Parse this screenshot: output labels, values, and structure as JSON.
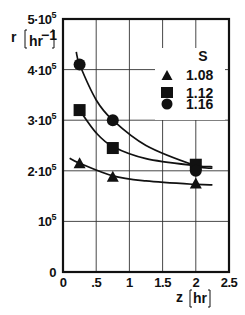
{
  "chart_data": {
    "type": "scatter",
    "title": "",
    "xlabel": "z",
    "xunit": "hr",
    "ylabel": "r",
    "yunit": "hr-1",
    "xlim": [
      0,
      2.5
    ],
    "ylim": [
      0,
      500000
    ],
    "grid": true,
    "x_ticks": [
      "0",
      ".5",
      "1",
      "1.5",
      "2",
      "2.5"
    ],
    "y_ticks": [
      {
        "value": 0,
        "base": "0",
        "exp": ""
      },
      {
        "value": 100000,
        "base": "10",
        "exp": "5"
      },
      {
        "value": 200000,
        "base": "2·10",
        "exp": "5"
      },
      {
        "value": 300000,
        "base": "3·10",
        "exp": "5"
      },
      {
        "value": 400000,
        "base": "4·10",
        "exp": "5"
      },
      {
        "value": 500000,
        "base": "5·10",
        "exp": "5"
      }
    ],
    "legend": {
      "title": "S",
      "position": "upper right",
      "entries": [
        {
          "label": "1.08",
          "marker": "triangle"
        },
        {
          "label": "1.12",
          "marker": "square"
        },
        {
          "label": "1.16",
          "marker": "circle"
        }
      ]
    },
    "series": [
      {
        "name": "1.08",
        "marker": "triangle",
        "x": [
          0.25,
          0.75,
          2.0
        ],
        "values": [
          215000,
          188000,
          175000
        ],
        "fit_curve": [
          [
            0.1,
            225000
          ],
          [
            0.25,
            215000
          ],
          [
            0.75,
            190000
          ],
          [
            1.25,
            180000
          ],
          [
            2.0,
            173000
          ],
          [
            2.25,
            172000
          ]
        ]
      },
      {
        "name": "1.12",
        "marker": "square",
        "x": [
          0.25,
          0.75,
          2.0
        ],
        "values": [
          320000,
          245000,
          212000
        ],
        "fit_curve": [
          [
            0.25,
            320000
          ],
          [
            0.5,
            275000
          ],
          [
            0.75,
            248000
          ],
          [
            1.25,
            224000
          ],
          [
            2.0,
            210000
          ],
          [
            2.25,
            208000
          ]
        ]
      },
      {
        "name": "1.16",
        "marker": "circle",
        "x": [
          0.25,
          0.75,
          2.0
        ],
        "values": [
          410000,
          300000,
          200000
        ],
        "fit_curve": [
          [
            0.2,
            435000
          ],
          [
            0.25,
            410000
          ],
          [
            0.5,
            340000
          ],
          [
            0.75,
            300000
          ],
          [
            1.25,
            250000
          ],
          [
            2.0,
            210000
          ],
          [
            2.25,
            205000
          ]
        ]
      }
    ]
  },
  "labels": {
    "y_axis_var": "r",
    "y_axis_unit": "hr",
    "y_axis_unit_exp": "−1",
    "x_axis_var": "z",
    "x_axis_unit": "hr",
    "legend_title": "S",
    "legend_1": "1.08",
    "legend_2": "1.12",
    "legend_3": "1.16"
  }
}
